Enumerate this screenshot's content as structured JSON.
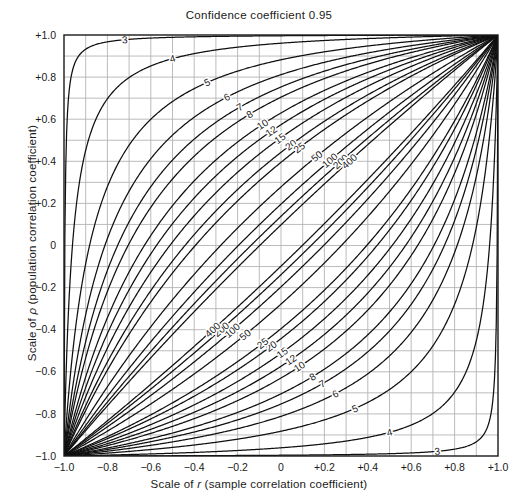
{
  "figure": {
    "title": "Confidence coefficient 0.95",
    "xaxis_label_prefix": "Scale of ",
    "xaxis_label_symbol": "r",
    "xaxis_label_suffix": " (sample correlation coefficient)",
    "yaxis_label_prefix": "Scale of ",
    "yaxis_label_symbol": "ρ",
    "yaxis_label_suffix": " (population correlation coefficient)"
  },
  "chart_data": {
    "type": "line",
    "title": "Confidence coefficient 0.95",
    "xlabel": "Scale of r (sample correlation coefficient)",
    "ylabel": "Scale of ρ (population correlation coefficient)",
    "xlim": [
      -1.0,
      1.0
    ],
    "ylim": [
      -1.0,
      1.0
    ],
    "grid": true,
    "grid_step": 0.1,
    "legend": "none",
    "confidence_coefficient": 0.95,
    "xticks": [
      -1.0,
      -0.8,
      -0.6,
      -0.4,
      -0.2,
      0,
      0.2,
      0.4,
      0.6,
      0.8,
      1.0
    ],
    "xticklabels": [
      "−1.0",
      "−0.8",
      "−0.6",
      "−0.4",
      "−0.2",
      "0",
      "+0.2",
      "+0.4",
      "+0.6",
      "+0.8",
      "+1.0"
    ],
    "yticks": [
      -1.0,
      -0.8,
      -0.6,
      -0.4,
      -0.2,
      0,
      0.2,
      0.4,
      0.6,
      0.8,
      1.0
    ],
    "yticklabels": [
      "−1.0",
      "−0.8",
      "−0.6",
      "−0.4",
      "−0.2",
      "0",
      "+0.2",
      "+0.4",
      "+0.6",
      "+0.8",
      "+1.0"
    ],
    "sample_sizes": [
      3,
      4,
      5,
      6,
      7,
      8,
      10,
      12,
      15,
      20,
      25,
      50,
      100,
      200,
      400
    ],
    "curve_labels_upper": [
      "3",
      "4",
      "5",
      "6",
      "7",
      "8",
      "10",
      "12",
      "15",
      "20",
      "25",
      "50",
      "100",
      "200",
      "400"
    ],
    "curve_labels_lower": [
      "400",
      "200",
      "100",
      "50",
      "25",
      "20",
      "15",
      "12",
      "10",
      "8",
      "7",
      "6",
      "5",
      "4",
      "3"
    ],
    "series": [
      {
        "name": "n=3",
        "n": 3
      },
      {
        "name": "n=4",
        "n": 4
      },
      {
        "name": "n=5",
        "n": 5
      },
      {
        "name": "n=6",
        "n": 6
      },
      {
        "name": "n=7",
        "n": 7
      },
      {
        "name": "n=8",
        "n": 8
      },
      {
        "name": "n=10",
        "n": 10
      },
      {
        "name": "n=12",
        "n": 12
      },
      {
        "name": "n=15",
        "n": 15
      },
      {
        "name": "n=20",
        "n": 20
      },
      {
        "name": "n=25",
        "n": 25
      },
      {
        "name": "n=50",
        "n": 50
      },
      {
        "name": "n=100",
        "n": 100
      },
      {
        "name": "n=200",
        "n": 200
      },
      {
        "name": "n=400",
        "n": 400
      }
    ]
  },
  "colors": {
    "curve": "#101010",
    "grid": "#b4b4b4",
    "frame": "#1a1a1a",
    "background": "#ffffff",
    "text": "#1a1a1a"
  }
}
